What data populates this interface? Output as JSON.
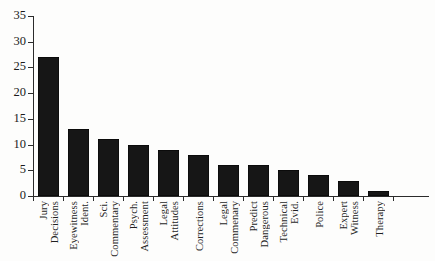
{
  "chart_data": {
    "type": "bar",
    "title": "",
    "subtitle": "",
    "xlabel": "",
    "ylabel": "",
    "ylim": [
      0,
      35
    ],
    "ytick_step": 5,
    "yticks": [
      0,
      5,
      10,
      15,
      20,
      25,
      30,
      35
    ],
    "grid": false,
    "legend": false,
    "legend_position": "none",
    "bar_color": "#161616",
    "axis_color": "#2b2b2b",
    "categories": [
      "Jury Decisions",
      "Eyewitness Ident.",
      "Sci. Commentary",
      "Psych. Assessment",
      "Legal Attitudes",
      "Corrections",
      "Legal Commenary",
      "Predict Dangerous",
      "Technical Evid.",
      "Police",
      "Expert Witness",
      "Therapy"
    ],
    "category_lines": [
      [
        "Jury",
        "Decisions"
      ],
      [
        "Eyewitness",
        "Ident."
      ],
      [
        "Sci.",
        "Commentary"
      ],
      [
        "Psych.",
        "Assessment"
      ],
      [
        "Legal",
        "Attitudes"
      ],
      [
        "Corrections"
      ],
      [
        "Legal",
        "Commenary"
      ],
      [
        "Predict",
        "Dangerous"
      ],
      [
        "Technical",
        "Evid."
      ],
      [
        "Police"
      ],
      [
        "Expert",
        "Witness"
      ],
      [
        "Therapy"
      ]
    ],
    "values": [
      27,
      13,
      11,
      10,
      9,
      8,
      6,
      6,
      5,
      4,
      3,
      1
    ]
  }
}
